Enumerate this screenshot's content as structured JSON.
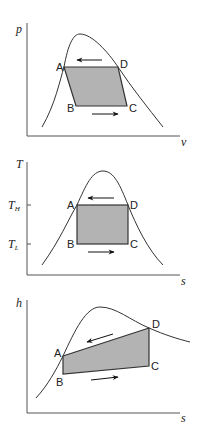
{
  "diagrams": [
    {
      "id": "pv",
      "y_axis_label": "p",
      "x_axis_label": "v",
      "points": {
        "A": "A",
        "B": "B",
        "C": "C",
        "D": "D"
      },
      "arrows": [
        "left (top, A←D)",
        "right (bottom, B→C)"
      ]
    },
    {
      "id": "ts",
      "y_axis_label": "T",
      "x_axis_label": "s",
      "y_ticks": [
        {
          "label": "T",
          "sub": "H"
        },
        {
          "label": "T",
          "sub": "L"
        }
      ],
      "points": {
        "A": "A",
        "B": "B",
        "C": "C",
        "D": "D"
      },
      "arrows": [
        "left (top, A←D)",
        "right (bottom, B→C)"
      ]
    },
    {
      "id": "hs",
      "y_axis_label": "h",
      "x_axis_label": "s",
      "points": {
        "A": "A",
        "B": "B",
        "C": "C",
        "D": "D"
      },
      "arrows": [
        "left (top, A←D)",
        "right (bottom, B→C)"
      ]
    }
  ],
  "colors": {
    "fill": "#b3b3b3",
    "line": "#333333",
    "axis": "#555555"
  }
}
